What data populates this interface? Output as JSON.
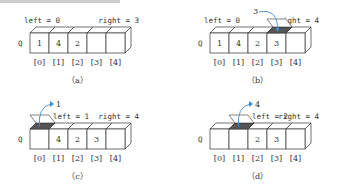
{
  "panels": [
    {
      "id": "a",
      "caption": "（a）",
      "left_label": "left = 0",
      "right_label": "right = 3",
      "queue_label": "Q",
      "cells": [
        "1",
        "4",
        "2",
        "",
        ""
      ],
      "indices": [
        "[0]",
        "[1]",
        "[2]",
        "[3]",
        "[4]"
      ],
      "action": null
    },
    {
      "id": "b",
      "caption": "（b）",
      "left_label": "left = 0",
      "right_label": "right = 4",
      "queue_label": "Q",
      "cells": [
        "1",
        "4",
        "2",
        "3",
        ""
      ],
      "indices": [
        "[0]",
        "[1]",
        "[2]",
        "[3]",
        "[4]"
      ],
      "action": {
        "type": "enqueue",
        "value": "3",
        "cell": 3
      }
    },
    {
      "id": "c",
      "caption": "（c）",
      "left_label": "left = 1",
      "right_label": "right = 4",
      "queue_label": "Q",
      "cells": [
        "",
        "4",
        "2",
        "3",
        ""
      ],
      "indices": [
        "[0]",
        "[1]",
        "[2]",
        "[3]",
        "[4]"
      ],
      "action": {
        "type": "dequeue",
        "value": "1",
        "cell": 0
      }
    },
    {
      "id": "d",
      "caption": "（d）",
      "left_label": "left = 2",
      "right_label": "right = 4",
      "queue_label": "Q",
      "cells": [
        "",
        "",
        "2",
        "3",
        ""
      ],
      "indices": [
        "[0]",
        "[1]",
        "[2]",
        "[3]",
        "[4]"
      ],
      "action": {
        "type": "dequeue",
        "value": "4",
        "cell": 1
      }
    }
  ],
  "colors": {
    "arrow": "#3a8fd6",
    "line": "#333333",
    "shade": "#555555"
  }
}
